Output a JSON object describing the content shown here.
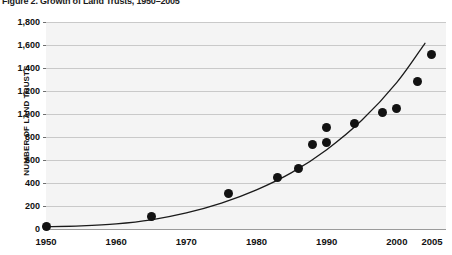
{
  "figure": {
    "title": "Figure 2. Growth of Land Trusts, 1950–2005"
  },
  "chart_data": {
    "type": "scatter",
    "title": "Figure 2. Growth of Land Trusts, 1950–2005",
    "xlabel": "",
    "ylabel": "NUMBER OF LAND TRUSTS",
    "xlim": [
      1950,
      2007
    ],
    "ylim": [
      0,
      1800
    ],
    "grid": true,
    "legend": "none",
    "x_ticks": [
      "1950",
      "1960",
      "1970",
      "1980",
      "1990",
      "2000",
      "2005"
    ],
    "x_tick_values": [
      1950,
      1960,
      1970,
      1980,
      1990,
      2000,
      2005
    ],
    "y_ticks": [
      "0",
      "200",
      "400",
      "600",
      "800",
      "1,000",
      "1,200",
      "1,400",
      "1,600",
      "1,800"
    ],
    "y_tick_values": [
      0,
      200,
      400,
      600,
      800,
      1000,
      1200,
      1400,
      1600,
      1800
    ],
    "series": [
      {
        "name": "Number of land trusts",
        "marker": "filled-circle",
        "color": "#121212",
        "points": [
          {
            "x": 1950,
            "y": 25
          },
          {
            "x": 1965,
            "y": 105
          },
          {
            "x": 1976,
            "y": 310
          },
          {
            "x": 1983,
            "y": 450
          },
          {
            "x": 1986,
            "y": 530
          },
          {
            "x": 1988,
            "y": 735
          },
          {
            "x": 1990,
            "y": 750
          },
          {
            "x": 1990,
            "y": 880
          },
          {
            "x": 1994,
            "y": 920
          },
          {
            "x": 1998,
            "y": 1010
          },
          {
            "x": 2000,
            "y": 1050
          },
          {
            "x": 2003,
            "y": 1280
          },
          {
            "x": 2005,
            "y": 1520
          }
        ]
      },
      {
        "name": "Fitted exponential trend",
        "marker": "none",
        "type": "line",
        "color": "#1a1a1a",
        "points": [
          {
            "x": 1950,
            "y": 20
          },
          {
            "x": 1955,
            "y": 28
          },
          {
            "x": 1960,
            "y": 45
          },
          {
            "x": 1965,
            "y": 80
          },
          {
            "x": 1970,
            "y": 140
          },
          {
            "x": 1975,
            "y": 225
          },
          {
            "x": 1980,
            "y": 340
          },
          {
            "x": 1985,
            "y": 490
          },
          {
            "x": 1990,
            "y": 690
          },
          {
            "x": 1995,
            "y": 945
          },
          {
            "x": 2000,
            "y": 1275
          },
          {
            "x": 2004,
            "y": 1615
          }
        ]
      }
    ]
  },
  "axes": {
    "y_title": "NUMBER OF LAND TRUSTS"
  }
}
